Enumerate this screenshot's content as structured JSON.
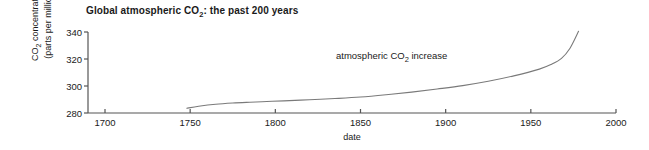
{
  "figure": {
    "title_prefix": "Global atmospheric CO",
    "title_sub": "2",
    "title_suffix": ": the past 200 years",
    "axis_color": "#555555",
    "line_color": "#7a7a7a",
    "text_color": "#1a1a1a"
  },
  "chart_data": {
    "type": "line",
    "title": "Global atmospheric CO2: the past 200 years",
    "xlabel": "date",
    "ylabel": "CO2 concentration (parts per million)",
    "ylabel_line1_prefix": "CO",
    "ylabel_line1_sub": "2",
    "ylabel_line1_suffix": " concentration",
    "ylabel_line2": "(parts per million)",
    "xlim": [
      1700,
      2000
    ],
    "ylim": [
      280,
      340
    ],
    "xticks": [
      1700,
      1750,
      1800,
      1850,
      1900,
      1950,
      2000
    ],
    "xtick_labels": [
      "1700",
      "1750",
      "1800",
      "1850",
      "1900",
      "1950",
      "2000"
    ],
    "yticks": [
      280,
      300,
      320,
      340
    ],
    "ytick_labels": [
      "280",
      "300",
      "320",
      "340"
    ],
    "grid": false,
    "legend": "none",
    "annotations": [
      {
        "text_prefix": "atmospheric CO",
        "text_sub": "2",
        "text_suffix": " increase",
        "text": "atmospheric CO2 increase",
        "x": 1850,
        "y": 325
      }
    ],
    "series": [
      {
        "name": "atmospheric CO2 increase",
        "x": [
          1748,
          1755,
          1765,
          1775,
          1785,
          1795,
          1805,
          1820,
          1835,
          1850,
          1865,
          1880,
          1895,
          1910,
          1925,
          1940,
          1955,
          1962,
          1968,
          1973,
          1978
        ],
        "values": [
          283.5,
          285.0,
          286.5,
          287.4,
          288.0,
          288.5,
          289.0,
          289.8,
          290.7,
          291.8,
          293.5,
          295.5,
          297.8,
          300.3,
          303.5,
          307.5,
          312.5,
          316.0,
          320.5,
          328.0,
          340.5
        ]
      }
    ]
  }
}
